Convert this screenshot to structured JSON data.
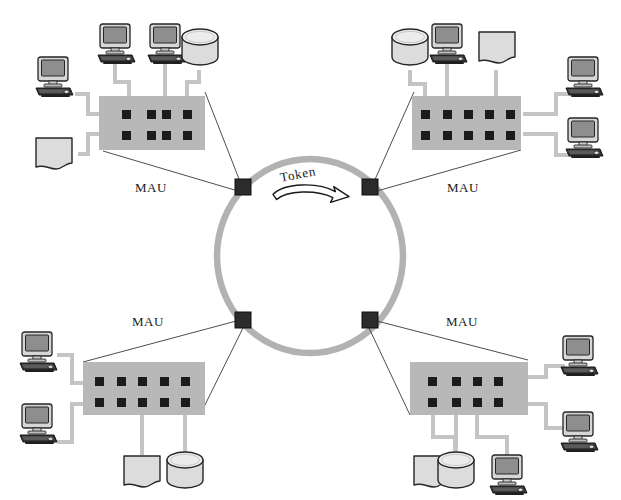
{
  "diagram": {
    "background_color": "#ffffff",
    "ring": {
      "label": "Token",
      "direction": "clockwise",
      "color": "#b2b2b2",
      "stroke_width": 6,
      "center": {
        "x": 310,
        "y": 256
      },
      "radius_x": 93,
      "radius_y": 97,
      "nodes": [
        {
          "id": "ring-node-top-left",
          "x": 243,
          "y": 187,
          "size": 15,
          "color": "#2b2b2b"
        },
        {
          "id": "ring-node-top-right",
          "x": 370,
          "y": 187,
          "size": 15,
          "color": "#2b2b2b"
        },
        {
          "id": "ring-node-bottom-left",
          "x": 243,
          "y": 320,
          "size": 15,
          "color": "#2b2b2b"
        },
        {
          "id": "ring-node-bottom-right",
          "x": 370,
          "y": 320,
          "size": 15,
          "color": "#2b2b2b"
        }
      ]
    },
    "colors": {
      "mau_fill": "#b8b8b8",
      "port": "#1c1c1c",
      "cable": "#c4c4c4",
      "outline": "#2a2a2a",
      "device_fill": "#d8d8d8",
      "screen_fill": "#9a9a9a"
    },
    "mau_units": [
      {
        "id": "mau-top-left",
        "label": "MAU",
        "label_x": 155,
        "label_y": 188,
        "ports_cols": 4,
        "ports_rows": 2,
        "devices": [
          {
            "type": "computer",
            "name": "workstation"
          },
          {
            "type": "computer",
            "name": "workstation"
          },
          {
            "type": "cylinder",
            "name": "storage"
          },
          {
            "type": "computer",
            "name": "workstation"
          },
          {
            "type": "document",
            "name": "printer"
          }
        ]
      },
      {
        "id": "mau-top-right",
        "label": "MAU",
        "label_x": 466,
        "label_y": 188,
        "ports_cols": 5,
        "ports_rows": 2,
        "devices": [
          {
            "type": "cylinder",
            "name": "storage"
          },
          {
            "type": "computer",
            "name": "workstation"
          },
          {
            "type": "document",
            "name": "printer"
          },
          {
            "type": "computer",
            "name": "workstation"
          },
          {
            "type": "computer",
            "name": "workstation"
          }
        ]
      },
      {
        "id": "mau-bottom-left",
        "label": "MAU",
        "label_x": 152,
        "label_y": 322,
        "ports_cols": 5,
        "ports_rows": 2,
        "devices": [
          {
            "type": "computer",
            "name": "workstation"
          },
          {
            "type": "computer",
            "name": "workstation"
          },
          {
            "type": "document",
            "name": "printer"
          },
          {
            "type": "cylinder",
            "name": "storage"
          }
        ]
      },
      {
        "id": "mau-bottom-right",
        "label": "MAU",
        "label_x": 466,
        "label_y": 322,
        "ports_cols": 4,
        "ports_rows": 2,
        "devices": [
          {
            "type": "computer",
            "name": "workstation"
          },
          {
            "type": "computer",
            "name": "workstation"
          },
          {
            "type": "document",
            "name": "printer"
          },
          {
            "type": "cylinder",
            "name": "storage"
          },
          {
            "type": "computer",
            "name": "workstation"
          }
        ]
      }
    ]
  }
}
